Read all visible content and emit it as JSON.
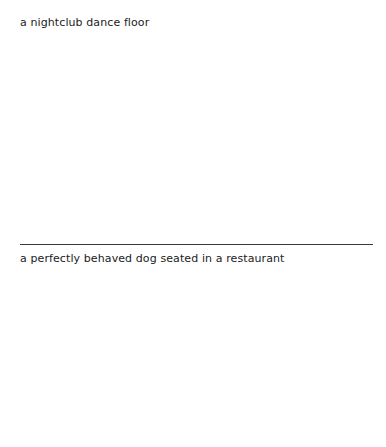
{
  "panels": [
    {
      "caption": "a nightclub dance floor"
    },
    {
      "caption": "a perfectly behaved dog seated in a restaurant"
    }
  ],
  "colors": {
    "background": "#ffffff",
    "text": "#222222",
    "divider": "#3a3a3a"
  }
}
